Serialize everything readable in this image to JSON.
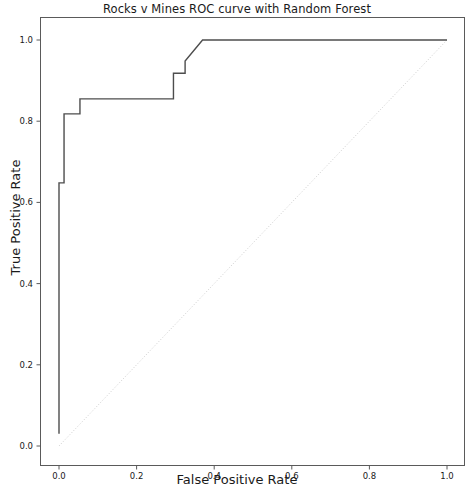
{
  "chart_data": {
    "type": "line",
    "title": "Rocks v Mines ROC curve with Random Forest",
    "xlabel": "False Positive Rate",
    "ylabel": "True Positive Rate",
    "xlim": [
      -0.02,
      1.05
    ],
    "ylim": [
      -0.03,
      1.05
    ],
    "xticks": [
      0.0,
      0.2,
      0.4,
      0.6,
      0.8,
      1.0
    ],
    "yticks": [
      0.0,
      0.2,
      0.4,
      0.6,
      0.8,
      1.0
    ],
    "xticklabels": [
      "0.0",
      "0.2",
      "0.4",
      "0.6",
      "0.8",
      "1.0"
    ],
    "yticklabels": [
      "0.0",
      "0.2",
      "0.4",
      "0.6",
      "0.8",
      "1.0"
    ],
    "grid": false,
    "legend": null,
    "series": [
      {
        "name": "ROC curve",
        "style": "solid",
        "color": "#4d4d4d",
        "linewidth": 1.4,
        "x": [
          0.0,
          0.0,
          0.013,
          0.013,
          0.054,
          0.054,
          0.27,
          0.295,
          0.295,
          0.325,
          0.325,
          0.37,
          1.0
        ],
        "y": [
          0.03,
          0.648,
          0.648,
          0.818,
          0.818,
          0.855,
          0.855,
          0.855,
          0.918,
          0.918,
          0.948,
          1.0,
          1.0
        ]
      },
      {
        "name": "random-chance-diagonal",
        "style": "dotted",
        "color": "#bfbfbf",
        "linewidth": 0.8,
        "x": [
          0.0,
          1.0
        ],
        "y": [
          0.0,
          1.0
        ]
      }
    ]
  },
  "axes": {
    "frame_color": "#5a5a5a",
    "tick_color": "#5a5a5a",
    "background": "#ffffff"
  }
}
